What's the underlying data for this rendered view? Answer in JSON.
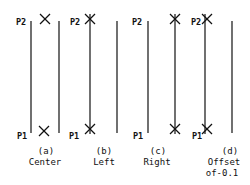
{
  "diagram": {
    "type": "line-justification-illustration",
    "panels": [
      {
        "id": "a",
        "caption_line1": "(a)",
        "caption_line2": "Center",
        "caption_line3": "",
        "p2_label": "P2",
        "p1_label": "P1",
        "x_position": "center"
      },
      {
        "id": "b",
        "caption_line1": "(b)",
        "caption_line2": "Left",
        "caption_line3": "",
        "p2_label": "P2",
        "p1_label": "P1",
        "x_position": "left"
      },
      {
        "id": "c",
        "caption_line1": "(c)",
        "caption_line2": "Right",
        "caption_line3": "",
        "p2_label": "P2",
        "p1_label": "P1",
        "x_position": "right"
      },
      {
        "id": "d",
        "caption_line1": "(d)",
        "caption_line2": "Offset",
        "caption_line3": "of-0.1",
        "p2_label": "P2",
        "p1_label": "P1",
        "x_position": "offset"
      }
    ],
    "colors": {
      "stroke": "#111111",
      "background": "#ffffff"
    }
  }
}
